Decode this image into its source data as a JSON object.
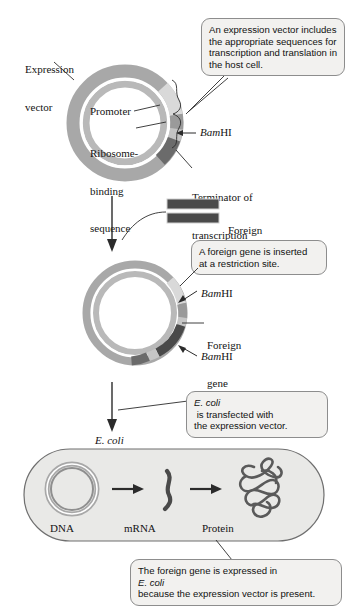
{
  "figure": {
    "type": "biology-process-diagram"
  },
  "colors": {
    "page_bg": "#ffffff",
    "ring_base": "#a8a8a8",
    "ring_inner_light": "#d8d8d8",
    "segment_promoter": "#d5d5d5",
    "segment_rbs": "#8f8f8f",
    "segment_terminator": "#6e6e6e",
    "segment_foreign_gene": "#4a4a4a",
    "segment_bamhi": "#9c9c9c",
    "callout_bg": "#f2f1ef",
    "callout_border": "#8d8d8d",
    "cell_fill": "#e9e9e7",
    "cell_border": "#6f6f6f",
    "line": "#2b2b2b"
  },
  "step1": {
    "vector_label_line1": "Expression",
    "vector_label_line2": "vector",
    "promoter_label": "Promoter",
    "rbs_label_line1": "Ribosome-",
    "rbs_label_line2": "binding",
    "rbs_label_line3": "sequence",
    "bamhi_label_italic": "Bam",
    "bamhi_label_rest": "HI",
    "terminator_line1": "Terminator of",
    "terminator_line2": "transcription",
    "callout": [
      "An expression vector includes",
      "the appropriate sequences for",
      "transcription and translation in",
      "the host cell."
    ]
  },
  "step2": {
    "foreign_gene_line1": "Foreign",
    "foreign_gene_line2": "gene",
    "callout": [
      "A foreign gene is inserted",
      "at a restriction site."
    ]
  },
  "step3": {
    "bamhi_top_italic": "Bam",
    "bamhi_top_rest": "HI",
    "bamhi_bottom_italic": "Bam",
    "bamhi_bottom_rest": "HI",
    "foreign_gene_line1": "Foreign",
    "foreign_gene_line2": "gene",
    "callout_italic": "E. coli",
    "callout_rest_line1": " is transfected with",
    "callout_line2": "the expression vector."
  },
  "step4": {
    "ecoli_label": "E. coli",
    "dna_label": "DNA",
    "mrna_label": "mRNA",
    "protein_label": "Protein",
    "callout_line1_a": "The foreign gene is expressed in ",
    "callout_line1_italic": "E. coli",
    "callout_line2": "because the expression vector is present."
  }
}
